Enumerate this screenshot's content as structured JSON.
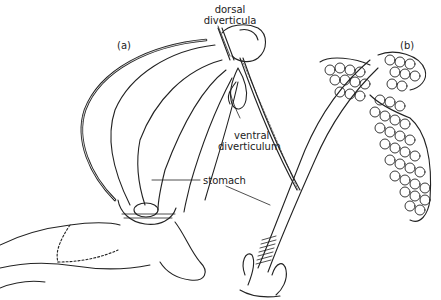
{
  "figure": {
    "panels": [
      {
        "id": "a",
        "label": "(a)"
      },
      {
        "id": "b",
        "label": "(b)"
      }
    ],
    "annotations": {
      "dorsal_line1": "dorsal",
      "dorsal_line2": "diverticula",
      "ventral_line1": "ventral",
      "ventral_line2": "diverticulum",
      "stomach": "stomach"
    },
    "colors": {
      "ink": "#222222",
      "background": "#ffffff"
    }
  }
}
